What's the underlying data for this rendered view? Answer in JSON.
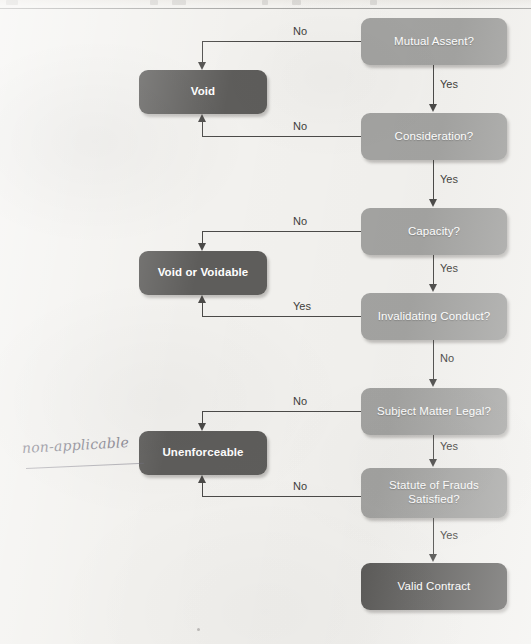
{
  "diagram": {
    "annotation": {
      "handwritten_note": "non-applicable"
    },
    "colors": {
      "page_background": "#f2f1ee",
      "decision_node": "#a3a3a1",
      "outcome_node": "#5e5d5b",
      "node_text": "#ffffff",
      "connector": "#4b4a48",
      "edge_label_text": "#3e3d3b",
      "handwriting": "#6e6c7a"
    },
    "decision_nodes": [
      {
        "id": "mutual-assent",
        "label": "Mutual Assent?"
      },
      {
        "id": "consideration",
        "label": "Consideration?"
      },
      {
        "id": "capacity",
        "label": "Capacity?"
      },
      {
        "id": "invalidating-conduct",
        "label": "Invalidating Conduct?"
      },
      {
        "id": "subject-matter-legal",
        "label": "Subject Matter Legal?"
      },
      {
        "id": "statute-of-frauds",
        "label_line1": "Statute of Frauds",
        "label_line2": "Satisfied?"
      }
    ],
    "outcome_nodes": [
      {
        "id": "void",
        "label": "Void"
      },
      {
        "id": "void-or-voidable",
        "label": "Void or Voidable"
      },
      {
        "id": "unenforceable",
        "label": "Unenforceable"
      },
      {
        "id": "valid-contract",
        "label": "Valid Contract"
      }
    ],
    "edges": [
      {
        "from": "mutual-assent",
        "to": "void",
        "label": "No"
      },
      {
        "from": "mutual-assent",
        "to": "consideration",
        "label": "Yes"
      },
      {
        "from": "consideration",
        "to": "void",
        "label": "No"
      },
      {
        "from": "consideration",
        "to": "capacity",
        "label": "Yes"
      },
      {
        "from": "capacity",
        "to": "void-or-voidable",
        "label": "No"
      },
      {
        "from": "capacity",
        "to": "invalidating-conduct",
        "label": "Yes"
      },
      {
        "from": "invalidating-conduct",
        "to": "void-or-voidable",
        "label": "Yes"
      },
      {
        "from": "invalidating-conduct",
        "to": "subject-matter-legal",
        "label": "No"
      },
      {
        "from": "subject-matter-legal",
        "to": "unenforceable",
        "label": "No"
      },
      {
        "from": "subject-matter-legal",
        "to": "statute-of-frauds",
        "label": "Yes"
      },
      {
        "from": "statute-of-frauds",
        "to": "unenforceable",
        "label": "No"
      },
      {
        "from": "statute-of-frauds",
        "to": "valid-contract",
        "label": "Yes"
      }
    ],
    "edge_labels": {
      "mutual_assent_no": "No",
      "mutual_assent_yes": "Yes",
      "consideration_no": "No",
      "consideration_yes": "Yes",
      "capacity_no": "No",
      "capacity_yes": "Yes",
      "invalidating_conduct_yes": "Yes",
      "invalidating_conduct_no": "No",
      "subject_matter_no": "No",
      "subject_matter_yes": "Yes",
      "statute_no": "No",
      "statute_yes": "Yes"
    }
  }
}
